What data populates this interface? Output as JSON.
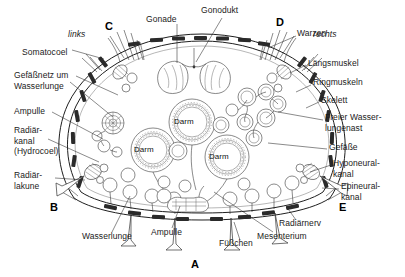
{
  "figure": {
    "title_implicit": "Querschnitt eines Seeigels/Echinodermen",
    "background_color": "#ffffff",
    "line_color": "#2b2b2b",
    "text_color": "#1b1b1b",
    "orientation": {
      "left_label": "links",
      "right_label": "rechts"
    },
    "section_letters": [
      {
        "key": "A",
        "label": "A",
        "x": 191,
        "y": 266
      },
      {
        "key": "B",
        "label": "B",
        "x": 50,
        "y": 208
      },
      {
        "key": "C",
        "label": "C",
        "x": 105,
        "y": 27
      },
      {
        "key": "D",
        "label": "D",
        "x": 276,
        "y": 23
      },
      {
        "key": "E",
        "label": "E",
        "x": 339,
        "y": 208
      }
    ],
    "labels_left": [
      {
        "id": "somatocoel",
        "text": "Somatocoel",
        "x": 22,
        "y": 53
      },
      {
        "id": "gefaessnetz",
        "text": "Gefäßnetz um\nWasserlunge",
        "x": 14,
        "y": 80
      },
      {
        "id": "ampulle-left",
        "text": "Ampulle",
        "x": 14,
        "y": 112
      },
      {
        "id": "radiaerkanal",
        "text": "Radiär-\nkanal\n(Hydrocoel)",
        "x": 14,
        "y": 137
      },
      {
        "id": "radiaerlakune",
        "text": "Radiär-\nlakune",
        "x": 14,
        "y": 176
      }
    ],
    "labels_top": [
      {
        "id": "gonade",
        "text": "Gonade",
        "x": 146,
        "y": 20
      },
      {
        "id": "gonodukt",
        "text": "Gonodukt",
        "x": 201,
        "y": 10
      }
    ],
    "labels_right": [
      {
        "id": "warzen",
        "text": "Warzen",
        "x": 297,
        "y": 33
      },
      {
        "id": "laengsmuskel",
        "text": "Längsmuskel",
        "x": 308,
        "y": 63
      },
      {
        "id": "ringmuskeln",
        "text": "Ringmuskeln",
        "x": 313,
        "y": 82
      },
      {
        "id": "skelett",
        "text": "Skelett",
        "x": 321,
        "y": 100
      },
      {
        "id": "freier-wasserlungenast",
        "text": "Freier Wasser-\nlungenast",
        "x": 325,
        "y": 117
      },
      {
        "id": "gefaesse",
        "text": "Gefäße",
        "x": 329,
        "y": 147
      },
      {
        "id": "hyponeuralkanal",
        "text": "Hyponeural-\nkanal",
        "x": 333,
        "y": 163
      },
      {
        "id": "epineuralkanal",
        "text": "Epineural-\nkanal",
        "x": 341,
        "y": 186
      }
    ],
    "labels_bottom": [
      {
        "id": "wasserlunge",
        "text": "Wasserlunge",
        "x": 82,
        "y": 237
      },
      {
        "id": "ampulle-bottom",
        "text": "Ampulle",
        "x": 151,
        "y": 233
      },
      {
        "id": "fuesschen",
        "text": "Füßchen",
        "x": 219,
        "y": 244
      },
      {
        "id": "mesenterium",
        "text": "Mesenterium",
        "x": 257,
        "y": 237
      },
      {
        "id": "radiaernerv",
        "text": "Radiärnerv",
        "x": 279,
        "y": 224
      }
    ],
    "inner_labels": [
      {
        "id": "darm-1",
        "text": "Darm",
        "x": 174,
        "y": 117
      },
      {
        "id": "darm-2",
        "text": "Darm",
        "x": 134,
        "y": 146
      },
      {
        "id": "darm-3",
        "text": "Darm",
        "x": 209,
        "y": 153
      }
    ]
  }
}
